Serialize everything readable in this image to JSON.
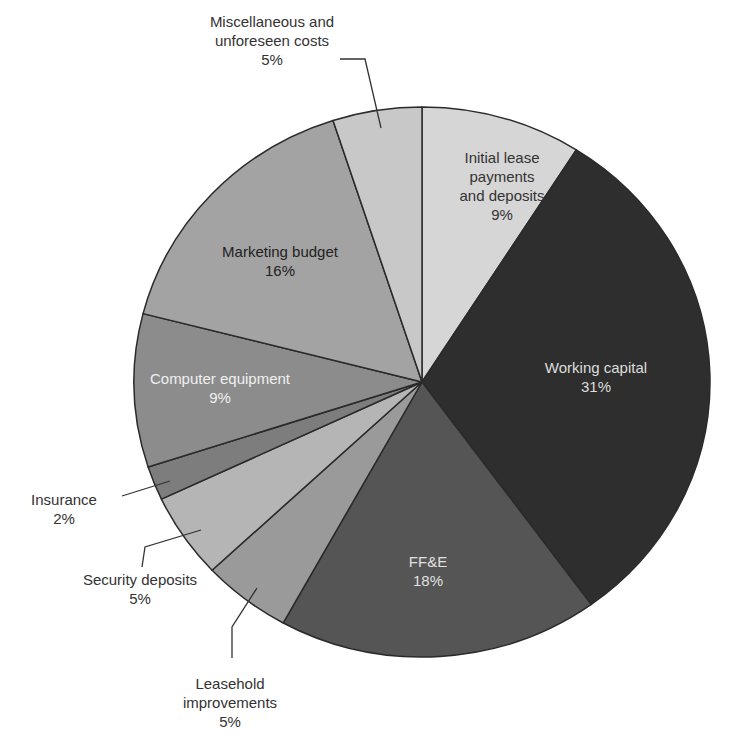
{
  "chart_data": {
    "type": "pie",
    "title": "",
    "start_angle_deg": 0,
    "direction": "clockwise",
    "unit": "%",
    "slices": [
      {
        "label": "Initial lease payments and deposits",
        "value": 9,
        "color": "#d6d6d6",
        "text_color": "#333333",
        "label_lines": [
          "Initial lease",
          "payments",
          "and deposits",
          "9%"
        ],
        "label_pos": [
          502,
          163
        ],
        "inside": true
      },
      {
        "label": "Working capital",
        "value": 31,
        "color": "#2e2e2e",
        "text_color": "#dddddd",
        "label_lines": [
          "Working capital",
          "31%"
        ],
        "label_pos": [
          596,
          373
        ],
        "inside": true
      },
      {
        "label": "FF&E",
        "value": 18,
        "color": "#555555",
        "text_color": "#e0e0e0",
        "label_lines": [
          "FF&E",
          "18%"
        ],
        "label_pos": [
          428,
          567
        ],
        "inside": true
      },
      {
        "label": "Leasehold improvements",
        "value": 5,
        "color": "#9a9a9a",
        "text_color": "#333333",
        "label_lines": [
          "Leasehold",
          "improvements",
          "5%"
        ],
        "label_pos": [
          230,
          689
        ],
        "inside": false,
        "leader": [
          [
            257,
            588
          ],
          [
            232,
            627
          ],
          [
            232,
            658
          ]
        ]
      },
      {
        "label": "Security deposits",
        "value": 5,
        "color": "#b5b5b5",
        "text_color": "#333333",
        "label_lines": [
          "Security deposits",
          "5%"
        ],
        "label_pos": [
          140,
          585
        ],
        "inside": false,
        "leader": [
          [
            201,
            530
          ],
          [
            145,
            547
          ],
          [
            142,
            567
          ]
        ]
      },
      {
        "label": "Insurance",
        "value": 2,
        "color": "#7d7d7d",
        "text_color": "#333333",
        "label_lines": [
          "Insurance",
          "2%"
        ],
        "label_pos": [
          64,
          505
        ],
        "inside": false,
        "leader": [
          [
            170,
            481
          ],
          [
            122,
            496
          ]
        ]
      },
      {
        "label": "Computer equipment",
        "value": 9,
        "color": "#8c8c8c",
        "text_color": "#f0f0f0",
        "label_lines": [
          "Computer equipment",
          "9%"
        ],
        "label_pos": [
          220,
          384
        ],
        "inside": true
      },
      {
        "label": "Marketing budget",
        "value": 16,
        "color": "#a3a3a3",
        "text_color": "#222222",
        "label_lines": [
          "Marketing budget",
          "16%"
        ],
        "label_pos": [
          280,
          257
        ],
        "inside": true
      },
      {
        "label": "Miscellaneous and unforeseen costs",
        "value": 5,
        "color": "#c8c8c8",
        "text_color": "#333333",
        "label_lines": [
          "Miscellaneous and",
          "unforeseen costs",
          "5%"
        ],
        "label_pos": [
          272,
          27
        ],
        "inside": false,
        "leader": [
          [
            381,
            128
          ],
          [
            365,
            59
          ],
          [
            340,
            59
          ]
        ]
      }
    ],
    "legend": null
  },
  "geometry": {
    "cx": 422,
    "cy": 382,
    "rx": 288,
    "ry": 275
  },
  "style": {
    "outline": "#2a2a2a",
    "leader": "#333333"
  }
}
